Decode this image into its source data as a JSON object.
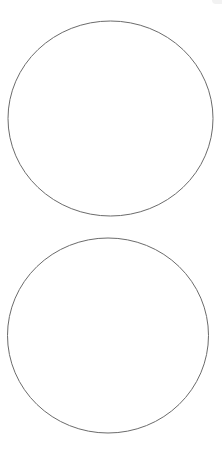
{
  "canvas": {
    "width": 222,
    "height": 449,
    "background": "#ffffff"
  },
  "shapes": [
    {
      "type": "ellipse",
      "name": "top-circle",
      "cx": 110.5,
      "cy": 118.5,
      "rx": 102.5,
      "ry": 97.5,
      "stroke": "#6b6b6b",
      "fill": "none"
    },
    {
      "type": "ellipse",
      "name": "bottom-circle",
      "cx": 108,
      "cy": 335.5,
      "rx": 100.5,
      "ry": 97.5,
      "stroke": "#6b6b6b",
      "fill": "none"
    }
  ]
}
